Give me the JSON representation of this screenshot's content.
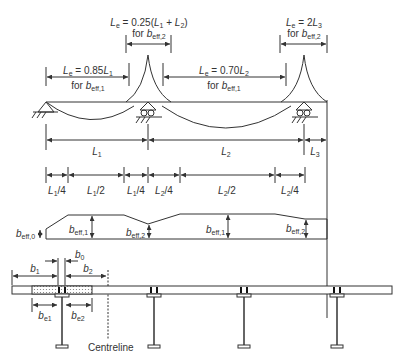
{
  "top_annotations": {
    "le_middle_support": {
      "formula": "L",
      "sub": "e",
      "expr": " = 0.25(",
      "L1": "L",
      "L1sub": "1",
      "plus": " + ",
      "L2": "L",
      "L2sub": "2",
      "close": ")",
      "for": "for ",
      "b": "b",
      "bsub": "eff,2"
    },
    "le_span1": {
      "prefix": "L",
      "sub": "e",
      "expr": " = 0.85",
      "var": "L",
      "varsub": "1",
      "for": "for ",
      "b": "b",
      "bsub": "eff,1"
    },
    "le_span2": {
      "prefix": "L",
      "sub": "e",
      "expr": " = 0.70",
      "var": "L",
      "varsub": "2",
      "for": "for ",
      "b": "b",
      "bsub": "eff,1"
    },
    "le_end_support": {
      "prefix": "L",
      "sub": "e",
      "expr": " = 2",
      "var": "L",
      "varsub": "3",
      "for": "for ",
      "b": "b",
      "bsub": "eff,2"
    }
  },
  "span_labels": [
    {
      "var": "L",
      "sub": "1"
    },
    {
      "var": "L",
      "sub": "2"
    },
    {
      "var": "L",
      "sub": "3"
    }
  ],
  "subdivision_labels": [
    {
      "var": "L",
      "sub": "1",
      "frac": "/4"
    },
    {
      "var": "L",
      "sub": "1",
      "frac": "/2"
    },
    {
      "var": "L",
      "sub": "1",
      "frac": "/4"
    },
    {
      "var": "L",
      "sub": "2",
      "frac": "/4"
    },
    {
      "var": "L",
      "sub": "2",
      "frac": "/2"
    },
    {
      "var": "L",
      "sub": "2",
      "frac": "/4"
    }
  ],
  "effective_width_labels": [
    {
      "var": "b",
      "sub": "eff,0"
    },
    {
      "var": "b",
      "sub": "eff,1"
    },
    {
      "var": "b",
      "sub": "eff,2"
    },
    {
      "var": "b",
      "sub": "eff,1"
    },
    {
      "var": "b",
      "sub": "eff,2"
    }
  ],
  "cross_section_labels": {
    "b0": {
      "var": "b",
      "sub": "0"
    },
    "b1": {
      "var": "b",
      "sub": "1"
    },
    "b2": {
      "var": "b",
      "sub": "2"
    },
    "be1": {
      "var": "b",
      "sub": "e1"
    },
    "be2": {
      "var": "b",
      "sub": "e2"
    },
    "centreline": "Centreline"
  },
  "colors": {
    "line": "#333333",
    "hatch": "#cccccc"
  }
}
